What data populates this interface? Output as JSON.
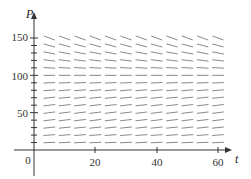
{
  "chart_data": {
    "type": "direction-field",
    "title": "",
    "xlabel": "t",
    "ylabel": "P",
    "xlim": [
      0,
      65
    ],
    "ylim": [
      0,
      160
    ],
    "x_ticks": [
      20,
      40,
      60
    ],
    "y_ticks": [
      50,
      100,
      150
    ],
    "origin_label": "0",
    "grid": false,
    "equilibrium_P": 100,
    "t_samples": [
      5,
      10,
      15,
      20,
      25,
      30,
      35,
      40,
      45,
      50,
      55,
      60
    ],
    "P_samples": [
      10,
      20,
      30,
      40,
      50,
      60,
      70,
      80,
      90,
      100,
      110,
      120,
      130,
      140,
      150
    ],
    "slope_model": "dP/dt = k*P*(1 - P/M)",
    "k": 0.02,
    "M": 100,
    "segment_color": "#8a8a8a",
    "axis_color": "#333333"
  },
  "labels": {
    "x_axis": "t",
    "y_axis": "P",
    "origin": "0",
    "x_tick_20": "20",
    "x_tick_40": "40",
    "x_tick_60": "60",
    "y_tick_50": "50",
    "y_tick_100": "100",
    "y_tick_150": "150"
  }
}
